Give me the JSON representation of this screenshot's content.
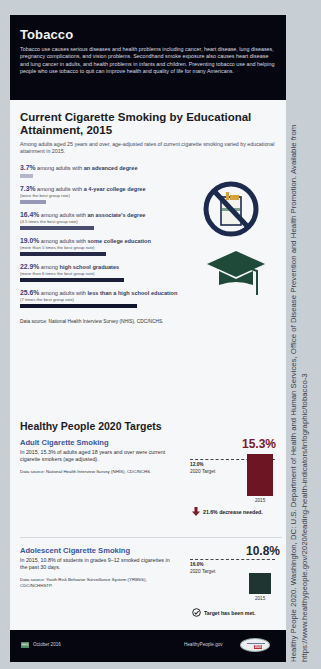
{
  "header": {
    "title": "Tobacco",
    "intro": "Tobacco use causes serious diseases and health problems including cancer, heart disease, lung diseases, pregnancy complications, and vision problems. Secondhand smoke exposure also causes heart disease and lung cancer in adults, and health problems in infants and children. Preventing tobacco use and helping people who use tobacco to quit can improve health and quality of life for many Americans."
  },
  "education": {
    "title": "Current Cigarette Smoking by Educational Attainment, 2015",
    "subtitle": "Among adults aged 25 years and over, age-adjusted rates of current cigarette smoking varied by educational attainment in 2015.",
    "rows": [
      {
        "value": "3.7%",
        "prefix": "among adults with ",
        "group": "an advanced degree",
        "note": "",
        "width": 13,
        "color": "#b5b8cc"
      },
      {
        "value": "7.3%",
        "prefix": "among adults with ",
        "group": "a 4-year college degree",
        "note": "(twice the best group rate)",
        "width": 26,
        "color": "#9599b6"
      },
      {
        "value": "16.4%",
        "prefix": "among adults with ",
        "group": "an associate's degree",
        "note": "(4.5 times the best group rate)",
        "width": 74,
        "color": "#4a4d6e"
      },
      {
        "value": "19.0%",
        "prefix": "among adults with ",
        "group": "some college education",
        "note": "(more than 5 times the best group rate)",
        "width": 86,
        "color": "#262a47"
      },
      {
        "value": "22.9%",
        "prefix": "among ",
        "group": "high school graduates",
        "note": "(more than 6 times the best group rate)",
        "width": 104,
        "color": "#1b1f3a"
      },
      {
        "value": "25.6%",
        "prefix": "among adults with ",
        "group": "less than a high school education",
        "note": "(7 times the best group rate)",
        "width": 117,
        "color": "#10142c"
      }
    ],
    "source": "Data source: National Health Interview Survey (NHIS), CDC/NCHS.",
    "icons": [
      "no-smoking-icon",
      "graduation-cap-icon"
    ]
  },
  "targets": {
    "title": "Healthy People 2020 Targets",
    "items": [
      {
        "name": "Adult Cigarette Smoking",
        "description": "In 2015, 15.3% of adults aged 18 years and over were current cigarette smokers (age adjusted).",
        "source": "Data source: National Health Interview Survey (NHIS), CDC/NCHS.",
        "value": "15.3%",
        "value_color": "#7a1a2c",
        "bar_color": "#6e1524",
        "target_value": "12.0%",
        "target_label": "2020 Target",
        "year": "2015",
        "status": "21.6% decrease needed.",
        "status_icon": "arrow-down-icon"
      },
      {
        "name": "Adolescent Cigarette Smoking",
        "description": "In 2015, 10.8% of students in grades 9–12 smoked cigarettes in the past 30 days.",
        "source": "Data source: Youth Risk Behavior Surveillance System (YRBSS), CDC/NCHHSTP.",
        "value": "10.8%",
        "value_color": "#1e2a2c",
        "bar_color": "#1e3532",
        "target_value": "16.0%",
        "target_label": "2020 Target",
        "year": "2015",
        "status": "Target has been met.",
        "status_icon": "checkmark-circle-icon"
      }
    ]
  },
  "footer": {
    "badge": "HHS",
    "date": "October 2016",
    "site": "HealthyPeople.gov",
    "logo_year": "2020"
  },
  "citation": {
    "line1": "Healthy People 2020. Washington, DC: U.S. Department of Health and Human Services, Office of Disease Prevention and Health Promotion. Available from",
    "line2": "https://www.healthypeople.gov/2020/leading-health-indicators/infographic/tobacco-3"
  }
}
